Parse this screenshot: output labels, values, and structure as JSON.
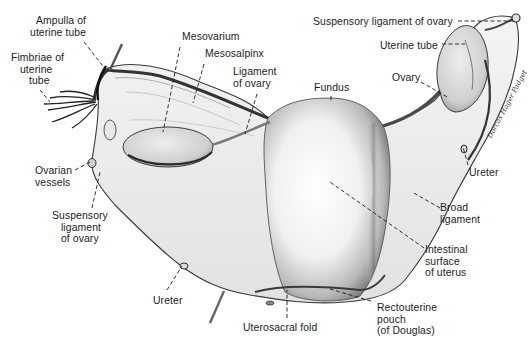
{
  "figure": {
    "colors": {
      "background": "#ffffff",
      "ink": "#1c1c1c",
      "shade_dark": "#5a5a5a",
      "shade_mid": "#a8a8a8",
      "shade_light": "#e4e4e4"
    },
    "signature": "Dorcas Hager Padget"
  },
  "labels": [
    {
      "id": "ampulla",
      "text": "Ampulla of\nuterine tube",
      "x": 30,
      "y": 15,
      "align": "r",
      "line": [
        [
          84,
          42
        ],
        [
          106,
          70
        ]
      ]
    },
    {
      "id": "fimbriae",
      "text": "Fimbriae of\n   uterine\n      tube",
      "x": 11,
      "y": 52,
      "align": "l",
      "line": [
        [
          40,
          90
        ],
        [
          50,
          102
        ]
      ]
    },
    {
      "id": "mesovarium",
      "text": "Mesovarium",
      "x": 182,
      "y": 31,
      "align": "l",
      "line": [
        [
          180,
          47
        ],
        [
          163,
          132
        ]
      ]
    },
    {
      "id": "mesosalpinx",
      "text": "Mesosalpinx",
      "x": 205,
      "y": 48,
      "align": "l",
      "line": [
        [
          204,
          64
        ],
        [
          193,
          103
        ]
      ]
    },
    {
      "id": "ligament_of_ovary",
      "text": "Ligament\nof ovary",
      "x": 233,
      "y": 66,
      "align": "l",
      "line": [
        [
          257,
          94
        ],
        [
          245,
          134
        ]
      ]
    },
    {
      "id": "fundus",
      "text": "Fundus",
      "x": 314,
      "y": 82,
      "align": "l",
      "line": [
        [
          331,
          96
        ],
        [
          331,
          101
        ]
      ]
    },
    {
      "id": "suspensory_top",
      "text": "Suspensory ligament of ovary",
      "x": 313,
      "y": 16,
      "align": "l",
      "line": [
        [
          458,
          21
        ],
        [
          515,
          21
        ]
      ]
    },
    {
      "id": "uterine_tube",
      "text": "Uterine tube",
      "x": 380,
      "y": 40,
      "align": "l",
      "line": [
        [
          442,
          44
        ],
        [
          465,
          44
        ]
      ]
    },
    {
      "id": "ovary",
      "text": "Ovary",
      "x": 392,
      "y": 72,
      "align": "l",
      "line": [
        [
          421,
          82
        ],
        [
          449,
          98
        ]
      ]
    },
    {
      "id": "ovarian_vessels",
      "text": "Ovarian\nvessels",
      "x": 35,
      "y": 165,
      "align": "l",
      "line": [
        [
          75,
          170
        ],
        [
          90,
          162
        ]
      ]
    },
    {
      "id": "suspensory_left",
      "text": "Suspensory\n   ligament\n   of ovary",
      "x": 52,
      "y": 210,
      "align": "l",
      "line": [
        [
          92,
          208
        ],
        [
          100,
          172
        ]
      ]
    },
    {
      "id": "ureter_right",
      "text": "Ureter",
      "x": 469,
      "y": 167,
      "align": "l",
      "line": [
        [
          468,
          165
        ],
        [
          463,
          147
        ]
      ]
    },
    {
      "id": "broad_ligament",
      "text": "Broad\nligament",
      "x": 440,
      "y": 202,
      "align": "l",
      "line": [
        [
          440,
          208
        ],
        [
          412,
          192
        ]
      ]
    },
    {
      "id": "intestinal_surface",
      "text": "Intestinal\nsurface\nof uterus",
      "x": 425,
      "y": 244,
      "align": "l",
      "line": [
        [
          424,
          248
        ],
        [
          330,
          182
        ]
      ]
    },
    {
      "id": "ureter_bottom",
      "text": "Ureter",
      "x": 153,
      "y": 295,
      "align": "l",
      "line": [
        [
          167,
          290
        ],
        [
          182,
          266
        ]
      ]
    },
    {
      "id": "uterosacral_fold",
      "text": "Uterosacral fold",
      "x": 243,
      "y": 322,
      "align": "l",
      "line": [
        [
          287,
          318
        ],
        [
          287,
          290
        ]
      ]
    },
    {
      "id": "rectouterine_pouch",
      "text": "Rectouterine\npouch\n(of Douglas)",
      "x": 377,
      "y": 302,
      "align": "l",
      "line": [
        [
          371,
          301
        ],
        [
          330,
          289
        ]
      ]
    }
  ]
}
